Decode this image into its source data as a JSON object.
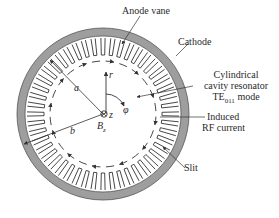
{
  "diagram": {
    "labels": {
      "anode_vane": "Anode vane",
      "cathode": "Cathode",
      "resonator_line1": "Cylindrical",
      "resonator_line2": "cavity resonator",
      "resonator_line3_main": "TE",
      "resonator_line3_sub": "011",
      "resonator_line3_tail": " mode",
      "induced_line1": "Induced",
      "induced_line2": "RF current",
      "slit": "Slit"
    },
    "symbols": {
      "r": "r",
      "phi": "φ",
      "z": "z",
      "a": "a",
      "b": "b",
      "Bz_main": "B",
      "Bz_sub": "z"
    },
    "geometry": {
      "center": [
        103,
        114
      ],
      "cathode_outer_radius": 86,
      "cathode_inner_radius": 78,
      "vane_inner_radius": 59,
      "vane_outer_radius": 76,
      "current_circle_radius": 53,
      "vane_count": 48
    },
    "colors": {
      "cathode_fill": "#9e9e9e",
      "line": "#333333",
      "background": "#ffffff"
    }
  }
}
